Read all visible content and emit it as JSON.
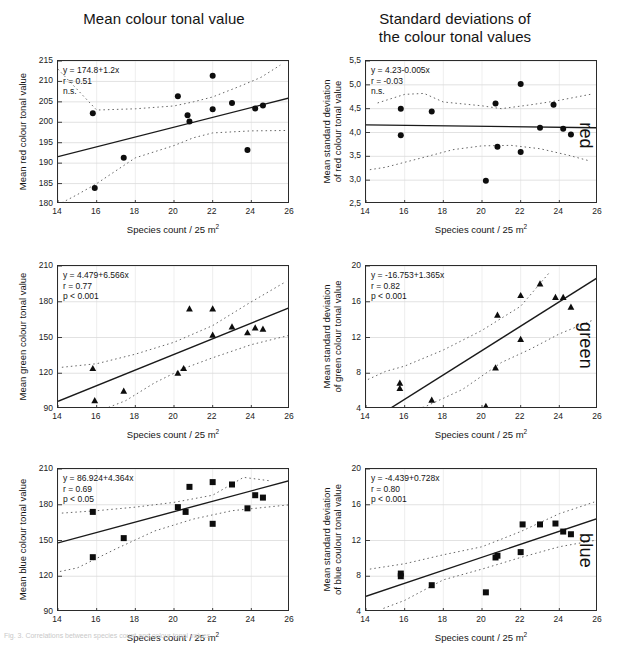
{
  "titles": {
    "left": "Mean colour tonal value",
    "right_line1": "Standard deviations of",
    "right_line2": "the colour tonal values"
  },
  "row_labels": {
    "red": "red",
    "green": "green",
    "blue": "blue"
  },
  "axis": {
    "xlabel_text": "Species count / 25 m",
    "xlabel_sup": "2"
  },
  "caption": "Fig. 3. Correlations between species count and colour tonal values.",
  "chart_data": [
    {
      "id": "red-mean",
      "type": "scatter",
      "title": "Mean colour tonal value",
      "row": "red",
      "xlabel": "Species count / 25 m2",
      "ylabel": "Mean red colour tonal value",
      "xlim": [
        14,
        26
      ],
      "ylim": [
        180,
        215
      ],
      "xticks": [
        14,
        16,
        18,
        20,
        22,
        24,
        26
      ],
      "yticks": [
        180,
        185,
        190,
        195,
        200,
        205,
        210,
        215
      ],
      "grid": true,
      "marker": "circle",
      "annotation": {
        "equation": "y = 174.8+1.2x",
        "r": "r = 0.51",
        "p": "n.s."
      },
      "fit": {
        "intercept": 174.8,
        "slope": 1.2
      },
      "points": [
        {
          "x": 15.8,
          "y": 202.2
        },
        {
          "x": 15.9,
          "y": 183.9
        },
        {
          "x": 17.4,
          "y": 191.3
        },
        {
          "x": 20.2,
          "y": 206.4
        },
        {
          "x": 20.7,
          "y": 201.7
        },
        {
          "x": 20.8,
          "y": 200.2
        },
        {
          "x": 22.0,
          "y": 211.4
        },
        {
          "x": 22.0,
          "y": 203.2
        },
        {
          "x": 23.0,
          "y": 204.7
        },
        {
          "x": 23.8,
          "y": 193.2
        },
        {
          "x": 24.2,
          "y": 203.4
        },
        {
          "x": 24.6,
          "y": 204.1
        }
      ],
      "ci_upper": [
        {
          "x": 14.0,
          "y": 213.0
        },
        {
          "x": 16.0,
          "y": 203.0
        },
        {
          "x": 18.0,
          "y": 203.3
        },
        {
          "x": 20.0,
          "y": 204.0
        },
        {
          "x": 21.0,
          "y": 205.0
        },
        {
          "x": 22.0,
          "y": 206.2
        },
        {
          "x": 23.5,
          "y": 209.0
        },
        {
          "x": 24.5,
          "y": 211.0
        },
        {
          "x": 25.5,
          "y": 214.0
        }
      ],
      "ci_lower": [
        {
          "x": 14.2,
          "y": 180.3
        },
        {
          "x": 15.0,
          "y": 182.3
        },
        {
          "x": 16.0,
          "y": 185.0
        },
        {
          "x": 18.0,
          "y": 191.3
        },
        {
          "x": 20.0,
          "y": 194.3
        },
        {
          "x": 21.0,
          "y": 196.2
        },
        {
          "x": 22.0,
          "y": 197.4
        },
        {
          "x": 24.0,
          "y": 197.9
        },
        {
          "x": 26.0,
          "y": 198.0
        }
      ]
    },
    {
      "id": "red-sd",
      "type": "scatter",
      "title": "Standard deviations of the colour tonal values",
      "row": "red",
      "xlabel": "Species count / 25 m2",
      "ylabel": "Mean standard deviation of red colour tonal value",
      "xlim": [
        14,
        26
      ],
      "ylim": [
        2.5,
        5.5
      ],
      "xticks": [
        14,
        16,
        18,
        20,
        22,
        24,
        26
      ],
      "yticks": [
        "2,5",
        "3,0",
        "3,5",
        "4,0",
        "4,5",
        "5,0",
        "5,5"
      ],
      "ytick_values": [
        2.5,
        3.0,
        3.5,
        4.0,
        4.5,
        5.0,
        5.5
      ],
      "grid": true,
      "marker": "circle",
      "annotation": {
        "equation": "y = 4.23-0.005x",
        "r": "r = -0.03",
        "p": "n.s."
      },
      "fit": {
        "intercept": 4.23,
        "slope": -0.005
      },
      "points": [
        {
          "x": 15.8,
          "y": 4.5
        },
        {
          "x": 15.8,
          "y": 3.94
        },
        {
          "x": 17.4,
          "y": 4.44
        },
        {
          "x": 20.2,
          "y": 2.99
        },
        {
          "x": 20.7,
          "y": 4.61
        },
        {
          "x": 20.8,
          "y": 3.7
        },
        {
          "x": 22.0,
          "y": 5.02
        },
        {
          "x": 22.0,
          "y": 3.59
        },
        {
          "x": 23.0,
          "y": 4.1
        },
        {
          "x": 23.7,
          "y": 4.58
        },
        {
          "x": 24.2,
          "y": 4.08
        },
        {
          "x": 24.6,
          "y": 3.96
        }
      ],
      "ci_upper": [
        {
          "x": 14.6,
          "y": 4.62
        },
        {
          "x": 16.0,
          "y": 4.8
        },
        {
          "x": 17.0,
          "y": 4.82
        },
        {
          "x": 18.0,
          "y": 4.64
        },
        {
          "x": 20.0,
          "y": 4.56
        },
        {
          "x": 21.0,
          "y": 4.5
        },
        {
          "x": 22.5,
          "y": 4.58
        },
        {
          "x": 23.8,
          "y": 4.66
        },
        {
          "x": 25.6,
          "y": 4.8
        }
      ],
      "ci_lower": [
        {
          "x": 14.2,
          "y": 3.22
        },
        {
          "x": 15.0,
          "y": 3.27
        },
        {
          "x": 17.0,
          "y": 3.48
        },
        {
          "x": 18.5,
          "y": 3.64
        },
        {
          "x": 20.0,
          "y": 3.72
        },
        {
          "x": 21.5,
          "y": 3.73
        },
        {
          "x": 23.0,
          "y": 3.66
        },
        {
          "x": 24.5,
          "y": 3.52
        },
        {
          "x": 25.6,
          "y": 3.4
        }
      ]
    },
    {
      "id": "green-mean",
      "type": "scatter",
      "title": "Mean colour tonal value",
      "row": "green",
      "xlabel": "Species count / 25 m2",
      "ylabel": "Mean green colour tonal value",
      "xlim": [
        14,
        26
      ],
      "ylim": [
        90,
        210
      ],
      "xticks": [
        14,
        16,
        18,
        20,
        22,
        24,
        26
      ],
      "yticks": [
        90,
        120,
        150,
        180,
        210
      ],
      "grid": true,
      "marker": "triangle",
      "annotation": {
        "equation": "y = 4.479+6.566x",
        "r": "r = 0.77",
        "p": "p < 0.001"
      },
      "fit": {
        "intercept": 4.479,
        "slope": 6.566
      },
      "points": [
        {
          "x": 15.8,
          "y": 124.0
        },
        {
          "x": 15.9,
          "y": 97.0
        },
        {
          "x": 17.4,
          "y": 105.0
        },
        {
          "x": 20.2,
          "y": 120.0
        },
        {
          "x": 20.5,
          "y": 124.0
        },
        {
          "x": 20.8,
          "y": 174.0
        },
        {
          "x": 22.0,
          "y": 152.0
        },
        {
          "x": 22.0,
          "y": 174.0
        },
        {
          "x": 23.0,
          "y": 159.0
        },
        {
          "x": 23.8,
          "y": 154.0
        },
        {
          "x": 24.2,
          "y": 158.0
        },
        {
          "x": 24.6,
          "y": 157.0
        }
      ],
      "ci_upper": [
        {
          "x": 14.2,
          "y": 125.0
        },
        {
          "x": 16.0,
          "y": 128.0
        },
        {
          "x": 18.0,
          "y": 136.0
        },
        {
          "x": 20.0,
          "y": 146.0
        },
        {
          "x": 22.0,
          "y": 160.0
        },
        {
          "x": 23.8,
          "y": 178.0
        },
        {
          "x": 25.8,
          "y": 197.0
        }
      ],
      "ci_lower": [
        {
          "x": 16.4,
          "y": 90.0
        },
        {
          "x": 17.5,
          "y": 97.0
        },
        {
          "x": 19.0,
          "y": 112.0
        },
        {
          "x": 20.5,
          "y": 124.0
        },
        {
          "x": 22.0,
          "y": 133.0
        },
        {
          "x": 24.0,
          "y": 144.0
        },
        {
          "x": 26.0,
          "y": 152.0
        }
      ]
    },
    {
      "id": "green-sd",
      "type": "scatter",
      "title": "Standard deviations of the colour tonal values",
      "row": "green",
      "xlabel": "Species count / 25 m2",
      "ylabel": "Mean standard deviation of green colour tonal value",
      "xlim": [
        14,
        26
      ],
      "ylim": [
        4,
        20
      ],
      "xticks": [
        14,
        16,
        18,
        20,
        22,
        24,
        26
      ],
      "yticks": [
        4,
        8,
        12,
        16,
        20
      ],
      "grid": true,
      "marker": "triangle",
      "annotation": {
        "equation": "y = -16.753+1.365x",
        "r": "r = 0.82",
        "p": "p < 0.001"
      },
      "fit": {
        "intercept": -16.753,
        "slope": 1.365
      },
      "points": [
        {
          "x": 15.75,
          "y": 6.9
        },
        {
          "x": 15.75,
          "y": 6.3
        },
        {
          "x": 17.4,
          "y": 5.0
        },
        {
          "x": 20.2,
          "y": 4.3
        },
        {
          "x": 20.7,
          "y": 8.6
        },
        {
          "x": 20.8,
          "y": 14.5
        },
        {
          "x": 22.0,
          "y": 11.8
        },
        {
          "x": 22.0,
          "y": 16.7
        },
        {
          "x": 23.0,
          "y": 18.0
        },
        {
          "x": 23.8,
          "y": 16.5
        },
        {
          "x": 24.2,
          "y": 16.5
        },
        {
          "x": 24.6,
          "y": 15.4
        }
      ],
      "ci_upper": [
        {
          "x": 14.1,
          "y": 7.3
        },
        {
          "x": 15.0,
          "y": 8.2
        },
        {
          "x": 16.0,
          "y": 8.8
        },
        {
          "x": 18.0,
          "y": 10.6
        },
        {
          "x": 20.0,
          "y": 12.8
        },
        {
          "x": 22.0,
          "y": 15.5
        },
        {
          "x": 23.5,
          "y": 19.3
        }
      ],
      "ci_lower": [
        {
          "x": 15.3,
          "y": 4.0
        },
        {
          "x": 17.0,
          "y": 4.2
        },
        {
          "x": 19.0,
          "y": 6.2
        },
        {
          "x": 21.0,
          "y": 9.2
        },
        {
          "x": 22.5,
          "y": 10.7
        },
        {
          "x": 24.0,
          "y": 12.4
        },
        {
          "x": 25.8,
          "y": 14.0
        }
      ]
    },
    {
      "id": "blue-mean",
      "type": "scatter",
      "title": "Mean colour tonal value",
      "row": "blue",
      "xlabel": "Species count / 25 m2",
      "ylabel": "Mean blue colour tonal value",
      "xlim": [
        14,
        26
      ],
      "ylim": [
        90,
        210
      ],
      "xticks": [
        14,
        16,
        18,
        20,
        22,
        24,
        26
      ],
      "yticks": [
        90,
        120,
        150,
        180,
        210
      ],
      "grid": true,
      "marker": "square",
      "annotation": {
        "equation": "y = 86.924+4.364x",
        "r": "r = 0.69",
        "p": "p < 0.05"
      },
      "fit": {
        "intercept": 86.924,
        "slope": 4.364
      },
      "points": [
        {
          "x": 15.8,
          "y": 174.0
        },
        {
          "x": 15.8,
          "y": 136.0
        },
        {
          "x": 17.4,
          "y": 152.0
        },
        {
          "x": 20.2,
          "y": 178.0
        },
        {
          "x": 20.6,
          "y": 174.0
        },
        {
          "x": 20.8,
          "y": 195.0
        },
        {
          "x": 22.0,
          "y": 199.0
        },
        {
          "x": 22.0,
          "y": 164.0
        },
        {
          "x": 23.0,
          "y": 197.0
        },
        {
          "x": 23.8,
          "y": 177.0
        },
        {
          "x": 24.2,
          "y": 188.0
        },
        {
          "x": 24.6,
          "y": 186.0
        }
      ],
      "ci_upper": [
        {
          "x": 14.2,
          "y": 173.0
        },
        {
          "x": 16.0,
          "y": 175.0
        },
        {
          "x": 18.0,
          "y": 178.0
        },
        {
          "x": 20.0,
          "y": 182.0
        },
        {
          "x": 22.0,
          "y": 188.0
        },
        {
          "x": 23.6,
          "y": 203.0
        },
        {
          "x": 25.0,
          "y": 200.0
        }
      ],
      "ci_lower": [
        {
          "x": 14.1,
          "y": 124.0
        },
        {
          "x": 15.0,
          "y": 127.0
        },
        {
          "x": 17.0,
          "y": 143.0
        },
        {
          "x": 19.0,
          "y": 158.0
        },
        {
          "x": 21.0,
          "y": 168.0
        },
        {
          "x": 23.0,
          "y": 175.0
        },
        {
          "x": 26.0,
          "y": 180.0
        }
      ]
    },
    {
      "id": "blue-sd",
      "type": "scatter",
      "title": "Standard deviations of the colour tonal values",
      "row": "blue",
      "xlabel": "Species count / 25 m2",
      "ylabel": "Mean standard deviation of blue coulour tonal value",
      "xlim": [
        14,
        26
      ],
      "ylim": [
        4,
        20
      ],
      "xticks": [
        14,
        16,
        18,
        20,
        22,
        24,
        26
      ],
      "yticks": [
        4,
        8,
        12,
        16,
        20
      ],
      "grid": true,
      "marker": "square",
      "annotation": {
        "equation": "y = -4.439+0.728x",
        "r": "r = 0.80",
        "p": "p < 0.001"
      },
      "fit": {
        "intercept": -4.439,
        "slope": 0.728
      },
      "points": [
        {
          "x": 15.8,
          "y": 8.3
        },
        {
          "x": 15.8,
          "y": 8.0
        },
        {
          "x": 17.4,
          "y": 7.0
        },
        {
          "x": 20.2,
          "y": 6.2
        },
        {
          "x": 20.7,
          "y": 10.1
        },
        {
          "x": 20.8,
          "y": 10.3
        },
        {
          "x": 22.0,
          "y": 10.7
        },
        {
          "x": 22.1,
          "y": 13.8
        },
        {
          "x": 23.0,
          "y": 13.8
        },
        {
          "x": 23.8,
          "y": 13.9
        },
        {
          "x": 24.2,
          "y": 13.0
        },
        {
          "x": 24.6,
          "y": 12.7
        }
      ],
      "ci_upper": [
        {
          "x": 14.2,
          "y": 8.8
        },
        {
          "x": 16.0,
          "y": 9.4
        },
        {
          "x": 18.0,
          "y": 10.4
        },
        {
          "x": 20.0,
          "y": 11.3
        },
        {
          "x": 22.0,
          "y": 13.0
        },
        {
          "x": 24.0,
          "y": 15.0
        },
        {
          "x": 25.8,
          "y": 16.3
        }
      ],
      "ci_lower": [
        {
          "x": 14.9,
          "y": 4.4
        },
        {
          "x": 16.0,
          "y": 5.3
        },
        {
          "x": 18.0,
          "y": 7.6
        },
        {
          "x": 20.0,
          "y": 8.8
        },
        {
          "x": 22.0,
          "y": 10.1
        },
        {
          "x": 24.0,
          "y": 11.3
        },
        {
          "x": 25.8,
          "y": 12.0
        }
      ]
    }
  ]
}
